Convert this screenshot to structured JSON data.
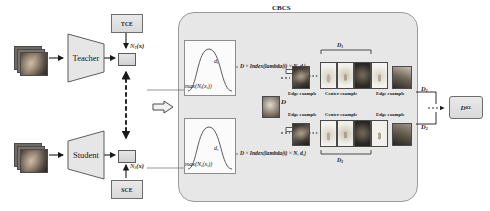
{
  "figure": {
    "module_title": "CBCS"
  },
  "left_branch": {
    "teacher": {
      "encoder_label": "Teacher",
      "loss_box_label": "TCE",
      "output_label": "N",
      "output_label_sub": "T",
      "output_label_tail": "(x)",
      "input_name": "input-image-teacher"
    },
    "student": {
      "encoder_label": "Student",
      "loss_box_label": "SCE",
      "output_label": "N",
      "output_label_sub": "S",
      "output_label_tail": "(x)",
      "input_name": "input-image-student"
    }
  },
  "cbcs": {
    "title": "CBCS",
    "top_curve_label": "max(N_t(x_i))",
    "top_curve_label_parts": {
      "fn": "max(",
      "n": "N",
      "sub": "t",
      "mid": "(x",
      "sub2": "i",
      "tail": "))"
    },
    "bottom_curve_label_parts": {
      "fn": "max(",
      "n": "N",
      "sub": "s",
      "mid": "(x",
      "sub2": "i",
      "tail": "))"
    },
    "axis_label_top": "d",
    "axis_label_top_sub": "t",
    "axis_label_bottom": "d",
    "axis_label_bottom_sub": "s",
    "formula_top": "D × Index(lambda(t) × N, d_t)",
    "formula_bottom": "D × Index(lambda(t) × N, d_s)",
    "formula_parts_top": {
      "d": "D",
      "times": "×",
      "fn": "Index(",
      "lambda": "lambda(t)",
      "times2": "×",
      "n": "N",
      "comma": ", ",
      "arg": "d",
      "arg_sub": "t",
      "close": ")"
    },
    "formula_parts_bottom": {
      "d": "D",
      "times": "×",
      "fn": "Index(",
      "lambda": "lambda(t)",
      "times2": "×",
      "n": "N",
      "comma": ", ",
      "arg": "d",
      "arg_sub": "s",
      "close": ")"
    },
    "dataset_label": "D",
    "rows": [
      {
        "id": "row-top",
        "bracket_label": "D",
        "bracket_label_sub": "1",
        "bracket_position": "above",
        "captions": [
          "Edge example",
          "Center example",
          "Edge example"
        ],
        "caption_position": "below",
        "example_count": 4
      },
      {
        "id": "row-bottom",
        "bracket_label": "D",
        "bracket_label_sub": "2",
        "bracket_position": "below",
        "captions": [
          "Edge example",
          "Center example",
          "Edge example"
        ],
        "caption_position": "above",
        "example_count": 4
      }
    ]
  },
  "output": {
    "branch_top_label": "D",
    "branch_top_sub": "1",
    "branch_bottom_label": "D",
    "branch_bottom_sub": "2",
    "kl_box_label": "D",
    "kl_box_sub": "KL"
  },
  "colors": {
    "panel_bg": "#e7e7e7",
    "box_fill": "#e3e3e3",
    "box_stroke": "#6d6d6d",
    "card_bg": "#fbfbfb",
    "text": "#16181c",
    "arrow": "#1a1a1a"
  }
}
